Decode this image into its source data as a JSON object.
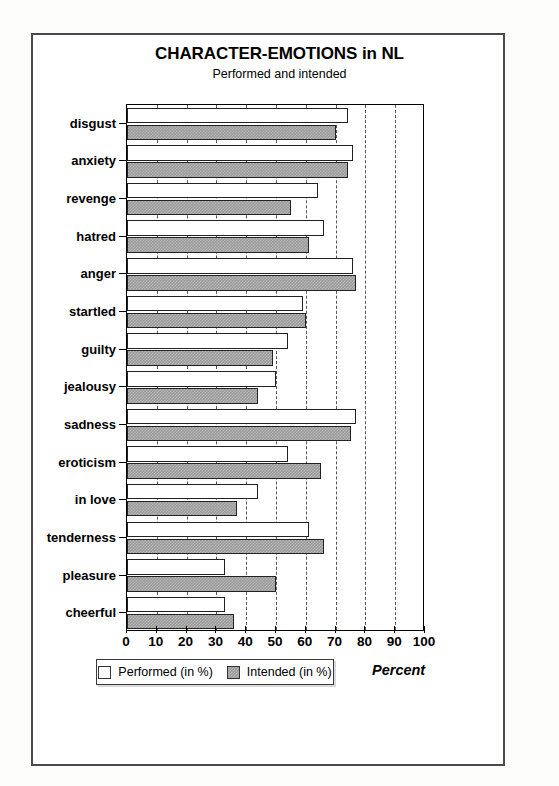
{
  "title": "CHARACTER-EMOTIONS in NL",
  "subtitle": "Performed and intended",
  "axis_caption": "Percent",
  "legend": {
    "performed_label": "Performed (in %)",
    "intended_label": "Intended (in %)"
  },
  "colors": {
    "performed_fill": "#ffffff",
    "intended_fill": "#9a9a9a",
    "bar_outline": "#222222",
    "frame": "#4a4a4a",
    "gridline": "#555555"
  },
  "chart_data": {
    "type": "bar",
    "orientation": "horizontal",
    "title": "CHARACTER-EMOTIONS in NL",
    "subtitle": "Performed and intended",
    "xlabel": "Percent",
    "ylabel": "",
    "xlim": [
      0,
      100
    ],
    "xticks": [
      0,
      10,
      20,
      30,
      40,
      50,
      60,
      70,
      80,
      90,
      100
    ],
    "xticklabels": [
      "0",
      "10",
      "20",
      "30",
      "40",
      "50",
      "60",
      "70",
      "80",
      "90",
      "100"
    ],
    "grid": "vertical dashed gridlines at every 10 units",
    "legend_position": "below axis, centered",
    "categories": [
      "disgust",
      "anxiety",
      "revenge",
      "hatred",
      "anger",
      "startled",
      "guilty",
      "jealousy",
      "sadness",
      "eroticism",
      "in love",
      "tenderness",
      "pleasure",
      "cheerful"
    ],
    "series": [
      {
        "name": "Performed (in %)",
        "values": [
          74,
          76,
          64,
          66,
          76,
          59,
          54,
          50,
          77,
          54,
          44,
          61,
          33,
          33
        ]
      },
      {
        "name": "Intended (in %)",
        "values": [
          70,
          74,
          55,
          61,
          77,
          60,
          49,
          44,
          75,
          65,
          37,
          66,
          50,
          36
        ]
      }
    ]
  }
}
